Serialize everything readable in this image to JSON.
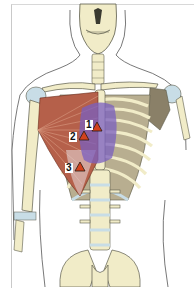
{
  "figure": {
    "colors": {
      "bone": "#f1ecc8",
      "bone_outline": "#5a5a4a",
      "cartilage": "#c8dde6",
      "muscle": "#b5604a",
      "muscle_light": "#d99a82",
      "referral_zone": "#7a5fc0",
      "ribcage_shadow": "#8a8068",
      "marker_fill": "#d2421e",
      "marker_outline": "#2a1a10",
      "skin_outline": "#444444"
    },
    "markers": [
      {
        "id": 1,
        "label": "1",
        "x": 97,
        "y": 128
      },
      {
        "id": 2,
        "label": "2",
        "x": 84,
        "y": 137
      },
      {
        "id": 3,
        "label": "3",
        "x": 80,
        "y": 168
      }
    ]
  }
}
